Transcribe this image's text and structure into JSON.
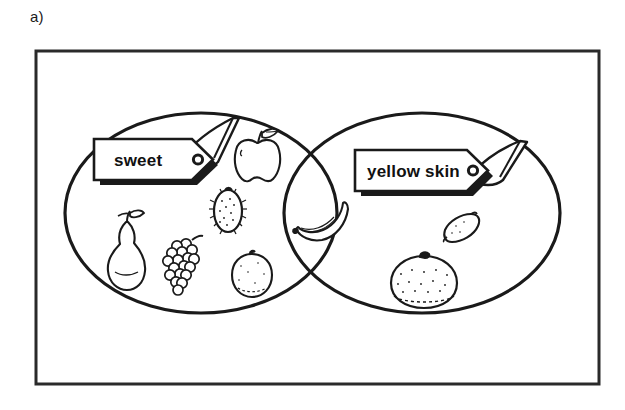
{
  "figure": {
    "panel_label": "a)",
    "type": "venn-diagram",
    "universe_frame": true
  },
  "diagram": {
    "sets": [
      {
        "id": "left-set",
        "tag_label": "sweet",
        "position": "left-ellipse",
        "members": [
          "apple",
          "kiwi",
          "pear",
          "grapes",
          "orange-round"
        ]
      },
      {
        "id": "right-set",
        "tag_label": "yellow skin",
        "position": "right-ellipse",
        "members": [
          "lemon",
          "grapefruit"
        ]
      }
    ],
    "intersection": {
      "id": "intersection",
      "members": [
        "banana"
      ]
    }
  },
  "icons": {
    "apple": "apple-icon",
    "kiwi": "kiwi-icon",
    "pear": "pear-icon",
    "grapes": "grapes-icon",
    "orange_round": "orange-icon",
    "banana": "banana-icon",
    "lemon": "lemon-icon",
    "grapefruit": "grapefruit-icon",
    "tag_left": "tag-sweet-icon",
    "tag_right": "tag-yellow-skin-icon"
  },
  "colors": {
    "ink": "#111111",
    "outline": "#1a1a1a",
    "paper": "#ffffff",
    "frame": "#2a2a2a"
  }
}
